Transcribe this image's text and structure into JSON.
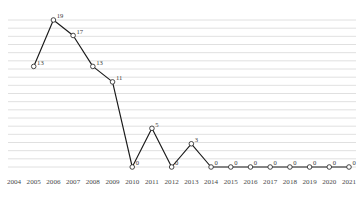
{
  "chart_data": {
    "type": "line",
    "title": "",
    "subtitle": "",
    "xlabel": "",
    "ylabel": "",
    "grid": true,
    "legend": false,
    "legend_position": "none",
    "categories": [
      "2004",
      "2005",
      "2006",
      "2007",
      "2008",
      "2009",
      "2010",
      "2011",
      "2012",
      "2013",
      "2014",
      "2015",
      "2016",
      "2017",
      "2018",
      "2019",
      "2020",
      "2021"
    ],
    "x": [
      2004,
      2005,
      2006,
      2007,
      2008,
      2009,
      2010,
      2011,
      2012,
      2013,
      2014,
      2015,
      2016,
      2017,
      2018,
      2019,
      2020,
      2021
    ],
    "values": [
      null,
      13,
      19,
      17,
      13,
      11,
      0,
      5,
      0,
      3,
      0,
      0,
      0,
      0,
      0,
      0,
      0,
      0
    ],
    "point_labels": [
      "",
      "13",
      "19",
      "17",
      "13",
      "11",
      "0",
      "5",
      "0",
      "3",
      "0",
      "0",
      "0",
      "0",
      "0",
      "0",
      "0",
      "0"
    ],
    "ylim": [
      0,
      19
    ],
    "xlim": [
      2004,
      2021
    ],
    "gridline_count": 19,
    "series": [
      {
        "name": "series-1",
        "values": [
          null,
          13,
          19,
          17,
          13,
          11,
          0,
          5,
          0,
          3,
          0,
          0,
          0,
          0,
          0,
          0,
          0,
          0
        ],
        "marker": "open-circle",
        "line_color": "#1a1a1a",
        "marker_color": "#1a1a1a"
      }
    ],
    "colors": {
      "line": "#1a1a1a",
      "marker_fill": "#ffffff",
      "marker_stroke": "#333333",
      "gridline": "#d8d8d8",
      "label_text": "#3a3a3a",
      "tick_text": "#4a4a4a",
      "background": "#ffffff"
    }
  },
  "axis": {
    "x_ticks": [
      "2004",
      "2005",
      "2006",
      "2007",
      "2008",
      "2009",
      "2010",
      "2011",
      "2012",
      "2013",
      "2014",
      "2015",
      "2016",
      "2017",
      "2018",
      "2019",
      "2020",
      "2021"
    ]
  }
}
